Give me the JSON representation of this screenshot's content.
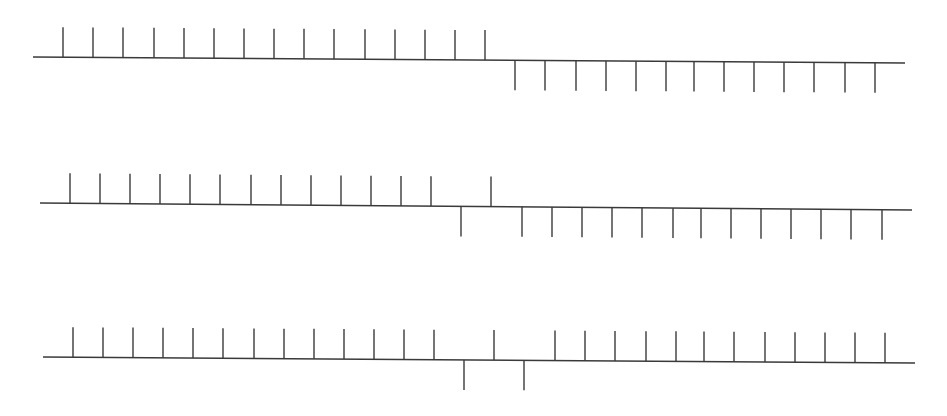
{
  "diagram": {
    "stroke_color": "#3a3a3a",
    "tick_length": 30,
    "rows": [
      {
        "name": "row-1",
        "line": {
          "x1": 33,
          "y1": 57,
          "x2": 905,
          "y2": 63
        },
        "ticks": [
          {
            "x": 63,
            "dir": "up"
          },
          {
            "x": 93,
            "dir": "up"
          },
          {
            "x": 123,
            "dir": "up"
          },
          {
            "x": 154,
            "dir": "up"
          },
          {
            "x": 184,
            "dir": "up"
          },
          {
            "x": 214,
            "dir": "up"
          },
          {
            "x": 244,
            "dir": "up"
          },
          {
            "x": 274,
            "dir": "up"
          },
          {
            "x": 304,
            "dir": "up"
          },
          {
            "x": 334,
            "dir": "up"
          },
          {
            "x": 365,
            "dir": "up"
          },
          {
            "x": 395,
            "dir": "up"
          },
          {
            "x": 425,
            "dir": "up"
          },
          {
            "x": 455,
            "dir": "up"
          },
          {
            "x": 485,
            "dir": "up"
          },
          {
            "x": 515,
            "dir": "down"
          },
          {
            "x": 545,
            "dir": "down"
          },
          {
            "x": 576,
            "dir": "down"
          },
          {
            "x": 606,
            "dir": "down"
          },
          {
            "x": 636,
            "dir": "down"
          },
          {
            "x": 666,
            "dir": "down"
          },
          {
            "x": 694,
            "dir": "down"
          },
          {
            "x": 724,
            "dir": "down"
          },
          {
            "x": 754,
            "dir": "down"
          },
          {
            "x": 784,
            "dir": "down"
          },
          {
            "x": 814,
            "dir": "down"
          },
          {
            "x": 845,
            "dir": "down"
          },
          {
            "x": 875,
            "dir": "down"
          }
        ]
      },
      {
        "name": "row-2",
        "line": {
          "x1": 40,
          "y1": 203,
          "x2": 912,
          "y2": 210
        },
        "ticks": [
          {
            "x": 70,
            "dir": "up"
          },
          {
            "x": 100,
            "dir": "up"
          },
          {
            "x": 130,
            "dir": "up"
          },
          {
            "x": 160,
            "dir": "up"
          },
          {
            "x": 190,
            "dir": "up"
          },
          {
            "x": 220,
            "dir": "up"
          },
          {
            "x": 251,
            "dir": "up"
          },
          {
            "x": 281,
            "dir": "up"
          },
          {
            "x": 311,
            "dir": "up"
          },
          {
            "x": 341,
            "dir": "up"
          },
          {
            "x": 371,
            "dir": "up"
          },
          {
            "x": 401,
            "dir": "up"
          },
          {
            "x": 431,
            "dir": "up"
          },
          {
            "x": 461,
            "dir": "down"
          },
          {
            "x": 491,
            "dir": "up"
          },
          {
            "x": 522,
            "dir": "down"
          },
          {
            "x": 552,
            "dir": "down"
          },
          {
            "x": 582,
            "dir": "down"
          },
          {
            "x": 612,
            "dir": "down"
          },
          {
            "x": 642,
            "dir": "down"
          },
          {
            "x": 673,
            "dir": "down"
          },
          {
            "x": 701,
            "dir": "down"
          },
          {
            "x": 731,
            "dir": "down"
          },
          {
            "x": 761,
            "dir": "down"
          },
          {
            "x": 791,
            "dir": "down"
          },
          {
            "x": 821,
            "dir": "down"
          },
          {
            "x": 851,
            "dir": "down"
          },
          {
            "x": 882,
            "dir": "down"
          }
        ]
      },
      {
        "name": "row-3",
        "line": {
          "x1": 43,
          "y1": 357,
          "x2": 915,
          "y2": 363
        },
        "ticks": [
          {
            "x": 73,
            "dir": "up"
          },
          {
            "x": 103,
            "dir": "up"
          },
          {
            "x": 133,
            "dir": "up"
          },
          {
            "x": 163,
            "dir": "up"
          },
          {
            "x": 193,
            "dir": "up"
          },
          {
            "x": 223,
            "dir": "up"
          },
          {
            "x": 254,
            "dir": "up"
          },
          {
            "x": 284,
            "dir": "up"
          },
          {
            "x": 314,
            "dir": "up"
          },
          {
            "x": 344,
            "dir": "up"
          },
          {
            "x": 374,
            "dir": "up"
          },
          {
            "x": 404,
            "dir": "up"
          },
          {
            "x": 434,
            "dir": "up"
          },
          {
            "x": 464,
            "dir": "down"
          },
          {
            "x": 494,
            "dir": "up"
          },
          {
            "x": 524,
            "dir": "down"
          },
          {
            "x": 555,
            "dir": "up"
          },
          {
            "x": 585,
            "dir": "up"
          },
          {
            "x": 615,
            "dir": "up"
          },
          {
            "x": 646,
            "dir": "up"
          },
          {
            "x": 676,
            "dir": "up"
          },
          {
            "x": 704,
            "dir": "up"
          },
          {
            "x": 734,
            "dir": "up"
          },
          {
            "x": 765,
            "dir": "up"
          },
          {
            "x": 795,
            "dir": "up"
          },
          {
            "x": 825,
            "dir": "up"
          },
          {
            "x": 855,
            "dir": "up"
          },
          {
            "x": 885,
            "dir": "up"
          }
        ]
      }
    ]
  }
}
